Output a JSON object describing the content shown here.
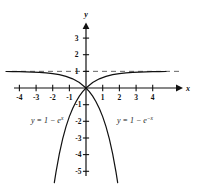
{
  "chart_data": {
    "type": "line",
    "title": "",
    "xlabel": "x",
    "ylabel": "y",
    "xlim": [
      -4.8,
      5.0
    ],
    "ylim": [
      -5.6,
      3.6
    ],
    "grid": false,
    "legend": "inline-annotations",
    "x_ticks": [
      -4,
      -3,
      -2,
      -1,
      1,
      2,
      3,
      4
    ],
    "x_tick_labels": [
      "-4",
      "-3",
      "-2",
      "-1",
      "1",
      "2",
      "3",
      "4"
    ],
    "y_ticks": [
      3,
      2,
      1,
      -1,
      -2,
      -3,
      -4,
      -5
    ],
    "y_tick_labels": [
      "3",
      "2",
      "1",
      "-1",
      "-2",
      "-3",
      "-4",
      "-5"
    ],
    "asymptote": {
      "kind": "horizontal",
      "y": 1,
      "style": "dashed"
    },
    "series": [
      {
        "name": "y = 1 - e^x",
        "label_text": "y = 1 - e",
        "label_sup": "x",
        "formula": "y = 1 - e^x",
        "x": [
          -4.8,
          -4.4,
          -4.0,
          -3.6,
          -3.2,
          -2.8,
          -2.4,
          -2.0,
          -1.6,
          -1.2,
          -0.8,
          -0.4,
          0.0,
          0.2,
          0.4,
          0.6,
          0.8,
          1.0,
          1.2,
          1.4,
          1.6,
          1.8,
          1.9
        ],
        "y": [
          0.9918,
          0.9877,
          0.9817,
          0.9727,
          0.9592,
          0.9392,
          0.9093,
          0.8647,
          0.7981,
          0.6988,
          0.5507,
          0.3297,
          0.0,
          -0.2214,
          -0.4918,
          -0.8221,
          -1.2255,
          -1.7183,
          -2.3201,
          -3.0552,
          -3.953,
          -5.0496,
          -5.6859
        ]
      },
      {
        "name": "y = 1 - e^-x",
        "label_text": "y = 1 - e",
        "label_sup": "-x",
        "formula": "y = 1 - e^{-x}",
        "x": [
          4.8,
          4.4,
          4.0,
          3.6,
          3.2,
          2.8,
          2.4,
          2.0,
          1.6,
          1.2,
          0.8,
          0.4,
          0.0,
          -0.2,
          -0.4,
          -0.6,
          -0.8,
          -1.0,
          -1.2,
          -1.4,
          -1.6,
          -1.8,
          -1.9
        ],
        "y": [
          0.9918,
          0.9877,
          0.9817,
          0.9727,
          0.9592,
          0.9392,
          0.9093,
          0.8647,
          0.7981,
          0.6988,
          0.5507,
          0.3297,
          0.0,
          -0.2214,
          -0.4918,
          -0.8221,
          -1.2255,
          -1.7183,
          -2.3201,
          -3.0552,
          -3.953,
          -5.0496,
          -5.6859
        ]
      }
    ],
    "annotations": [
      {
        "text": "y = 1 - e^x",
        "at": [
          -2.6,
          -2.1
        ]
      },
      {
        "text": "y = 1 - e^-x",
        "at": [
          2.0,
          -2.1
        ]
      }
    ],
    "axis_arrows": [
      "x-right",
      "y-up"
    ],
    "colors": {
      "axis": "#111111",
      "curve": "#111111",
      "asymptote": "#555555",
      "background": "#ffffff"
    }
  },
  "labels": {
    "x_axis": "x",
    "y_axis": "y",
    "left_equation_lhs": "y = 1 − e",
    "left_equation_exp": "x",
    "right_equation_lhs": "y = 1 − e",
    "right_equation_exp": "−x",
    "tick_neg4": "-4",
    "tick_neg3": "-3",
    "tick_neg2": "-2",
    "tick_neg1": "-1",
    "tick_pos1": "1",
    "tick_pos2": "2",
    "tick_pos3": "3",
    "tick_pos4": "4",
    "tick_y3": "3",
    "tick_y2": "2",
    "tick_y1": "1",
    "tick_yneg1": "-1",
    "tick_yneg2": "-2",
    "tick_yneg3": "-3",
    "tick_yneg4": "-4",
    "tick_yneg5": "-5"
  }
}
